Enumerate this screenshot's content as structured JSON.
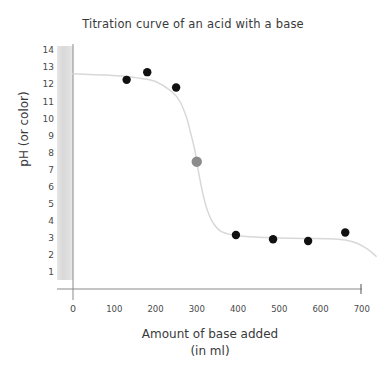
{
  "chart_data": {
    "type": "line",
    "title": "Titration curve of an acid with a base",
    "xlabel_line1": "Amount of base added",
    "xlabel_line2": "(in ml)",
    "ylabel": "pH (or color)",
    "xlim": [
      0,
      740
    ],
    "ylim": [
      0,
      14.6
    ],
    "xticks": [
      0,
      100,
      200,
      300,
      400,
      500,
      600,
      700
    ],
    "yticks": [
      1,
      2,
      3,
      4,
      5,
      6,
      7,
      8,
      9,
      10,
      11,
      12,
      13,
      14
    ],
    "grid": false,
    "legend": "none",
    "series": [
      {
        "name": "Titration curve",
        "type": "line",
        "color": "#d8d8d8",
        "x": [
          0,
          40,
          80,
          120,
          160,
          200,
          240,
          260,
          275,
          285,
          295,
          300,
          305,
          315,
          325,
          340,
          360,
          400,
          440,
          500,
          560,
          620,
          660,
          690,
          715,
          735
        ],
        "y": [
          12.65,
          12.62,
          12.58,
          12.52,
          12.4,
          12.2,
          11.6,
          11.0,
          10.1,
          9.2,
          8.2,
          7.5,
          6.8,
          5.6,
          4.7,
          3.9,
          3.4,
          3.15,
          3.08,
          3.03,
          3.0,
          2.98,
          2.9,
          2.7,
          2.35,
          1.95
        ]
      },
      {
        "name": "Measured points",
        "type": "scatter",
        "color": "#111111",
        "radius": 4.2,
        "points": [
          {
            "x": 130,
            "y": 12.3
          },
          {
            "x": 180,
            "y": 12.75
          },
          {
            "x": 250,
            "y": 11.85
          },
          {
            "x": 395,
            "y": 3.2
          },
          {
            "x": 485,
            "y": 2.95
          },
          {
            "x": 570,
            "y": 2.85
          },
          {
            "x": 660,
            "y": 3.35
          }
        ]
      },
      {
        "name": "Equivalence point",
        "type": "scatter",
        "color": "#8c8c8c",
        "radius": 5.2,
        "points": [
          {
            "x": 300,
            "y": 7.5
          }
        ]
      }
    ],
    "annotations": {
      "gray_band_label": "color indicator band",
      "gray_band_color": "#dcdcdc"
    }
  },
  "axis": {
    "line_color": "#8a8a8a"
  }
}
